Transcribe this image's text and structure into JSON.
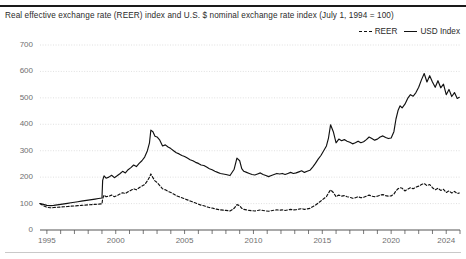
{
  "header": {
    "title_partial": "",
    "subtitle": "Real effective exchange rate (REER) index and U.S. $ nominal exchange rate index (July 1, 1994 = 100)"
  },
  "legend": {
    "position": "top-right",
    "items": [
      {
        "label": "REER",
        "style": "dashed",
        "color": "#111111"
      },
      {
        "label": "USD Index",
        "style": "solid",
        "color": "#111111"
      }
    ]
  },
  "axes": {
    "y_ticks": [
      "700",
      "600",
      "500",
      "400",
      "300",
      "200",
      "100",
      "0"
    ],
    "x_ticks": [
      "1995",
      "2000",
      "2005",
      "2010",
      "2015",
      "2020",
      "2024"
    ]
  },
  "colors": {
    "ink": "#231f20",
    "grid": "#d8d8d8",
    "axis": "#555555",
    "tick_text": "#6f6f6f",
    "series": "#111111"
  },
  "chart_data": {
    "type": "line",
    "title": "Real effective exchange rate (REER) index and U.S. $ nominal exchange rate index (July 1, 1994 = 100)",
    "xlabel": "",
    "ylabel": "",
    "xlim": [
      1994.5,
      2025.0
    ],
    "ylim": [
      0,
      700
    ],
    "grid": true,
    "legend_position": "top-right",
    "y_ticks": [
      0,
      100,
      200,
      300,
      400,
      500,
      600,
      700
    ],
    "x_ticks": [
      1995,
      2000,
      2005,
      2010,
      2015,
      2020,
      2024
    ],
    "x_tick_interval_minor": 1,
    "series": [
      {
        "name": "USD Index",
        "style": "solid",
        "color": "#111111",
        "x": [
          1994.5,
          1994.75,
          1995.0,
          1995.25,
          1995.5,
          1995.75,
          1996.0,
          1996.25,
          1996.5,
          1996.75,
          1997.0,
          1997.25,
          1997.5,
          1997.75,
          1998.0,
          1998.25,
          1998.5,
          1998.75,
          1999.0,
          1999.05,
          1999.15,
          1999.3,
          1999.5,
          1999.7,
          1999.9,
          2000.1,
          2000.3,
          2000.5,
          2000.7,
          2000.9,
          2001.1,
          2001.3,
          2001.5,
          2001.7,
          2001.9,
          2002.1,
          2002.3,
          2002.45,
          2002.55,
          2002.7,
          2002.85,
          2003.0,
          2003.2,
          2003.4,
          2003.6,
          2003.8,
          2004.0,
          2004.2,
          2004.4,
          2004.6,
          2004.8,
          2005.0,
          2005.2,
          2005.4,
          2005.6,
          2005.8,
          2006.0,
          2006.2,
          2006.4,
          2006.6,
          2006.8,
          2007.0,
          2007.2,
          2007.4,
          2007.6,
          2007.8,
          2008.0,
          2008.3,
          2008.6,
          2008.8,
          2009.0,
          2009.15,
          2009.3,
          2009.5,
          2009.7,
          2009.9,
          2010.1,
          2010.3,
          2010.5,
          2010.7,
          2010.9,
          2011.1,
          2011.3,
          2011.5,
          2011.7,
          2011.9,
          2012.1,
          2012.3,
          2012.5,
          2012.7,
          2012.9,
          2013.1,
          2013.3,
          2013.5,
          2013.7,
          2013.9,
          2014.1,
          2014.3,
          2014.5,
          2014.7,
          2014.9,
          2015.1,
          2015.3,
          2015.45,
          2015.6,
          2015.8,
          2016.0,
          2016.2,
          2016.4,
          2016.6,
          2016.8,
          2017.0,
          2017.2,
          2017.4,
          2017.6,
          2017.8,
          2018.0,
          2018.2,
          2018.4,
          2018.6,
          2018.8,
          2019.0,
          2019.2,
          2019.4,
          2019.6,
          2019.8,
          2020.0,
          2020.2,
          2020.35,
          2020.5,
          2020.65,
          2020.8,
          2021.0,
          2021.2,
          2021.4,
          2021.6,
          2021.8,
          2022.0,
          2022.2,
          2022.4,
          2022.6,
          2022.8,
          2023.0,
          2023.2,
          2023.4,
          2023.6,
          2023.8,
          2024.0,
          2024.2,
          2024.4,
          2024.6,
          2024.8,
          2024.95
        ],
        "y": [
          100,
          97,
          93,
          92,
          93,
          95,
          97,
          99,
          101,
          103,
          105,
          107,
          109,
          111,
          113,
          115,
          117,
          119,
          121,
          188,
          205,
          196,
          200,
          207,
          198,
          205,
          213,
          222,
          216,
          228,
          236,
          246,
          240,
          252,
          262,
          276,
          300,
          330,
          378,
          372,
          355,
          352,
          340,
          318,
          322,
          314,
          308,
          300,
          292,
          288,
          282,
          278,
          272,
          266,
          262,
          256,
          252,
          246,
          244,
          238,
          232,
          228,
          222,
          218,
          214,
          212,
          210,
          206,
          230,
          272,
          262,
          232,
          222,
          218,
          214,
          210,
          208,
          212,
          216,
          210,
          206,
          202,
          206,
          210,
          214,
          212,
          214,
          210,
          214,
          218,
          214,
          216,
          220,
          224,
          218,
          222,
          226,
          238,
          252,
          268,
          282,
          300,
          318,
          348,
          398,
          372,
          330,
          344,
          338,
          342,
          336,
          332,
          326,
          330,
          336,
          330,
          334,
          342,
          352,
          346,
          340,
          344,
          352,
          356,
          350,
          346,
          348,
          372,
          420,
          452,
          470,
          462,
          476,
          498,
          512,
          506,
          520,
          540,
          568,
          592,
          560,
          584,
          560,
          540,
          565,
          538,
          552,
          512,
          532,
          505,
          520,
          498,
          502
        ]
      },
      {
        "name": "REER",
        "style": "dashed",
        "color": "#111111",
        "x": [
          1994.5,
          1994.75,
          1995.0,
          1995.25,
          1995.5,
          1995.75,
          1996.0,
          1996.25,
          1996.5,
          1996.75,
          1997.0,
          1997.25,
          1997.5,
          1997.75,
          1998.0,
          1998.25,
          1998.5,
          1998.75,
          1999.0,
          1999.05,
          1999.15,
          1999.3,
          1999.5,
          1999.7,
          1999.9,
          2000.1,
          2000.3,
          2000.5,
          2000.7,
          2000.9,
          2001.1,
          2001.3,
          2001.5,
          2001.7,
          2001.9,
          2002.1,
          2002.3,
          2002.45,
          2002.55,
          2002.7,
          2002.85,
          2003.0,
          2003.2,
          2003.4,
          2003.6,
          2003.8,
          2004.0,
          2004.2,
          2004.4,
          2004.6,
          2004.8,
          2005.0,
          2005.2,
          2005.4,
          2005.6,
          2005.8,
          2006.0,
          2006.2,
          2006.4,
          2006.6,
          2006.8,
          2007.0,
          2007.2,
          2007.4,
          2007.6,
          2007.8,
          2008.0,
          2008.3,
          2008.6,
          2008.8,
          2009.0,
          2009.15,
          2009.3,
          2009.5,
          2009.7,
          2009.9,
          2010.1,
          2010.3,
          2010.5,
          2010.7,
          2010.9,
          2011.1,
          2011.3,
          2011.5,
          2011.7,
          2011.9,
          2012.1,
          2012.3,
          2012.5,
          2012.7,
          2012.9,
          2013.1,
          2013.3,
          2013.5,
          2013.7,
          2013.9,
          2014.1,
          2014.3,
          2014.5,
          2014.7,
          2014.9,
          2015.1,
          2015.3,
          2015.45,
          2015.6,
          2015.8,
          2016.0,
          2016.2,
          2016.4,
          2016.6,
          2016.8,
          2017.0,
          2017.2,
          2017.4,
          2017.6,
          2017.8,
          2018.0,
          2018.2,
          2018.4,
          2018.6,
          2018.8,
          2019.0,
          2019.2,
          2019.4,
          2019.6,
          2019.8,
          2020.0,
          2020.2,
          2020.35,
          2020.5,
          2020.65,
          2020.8,
          2021.0,
          2021.2,
          2021.4,
          2021.6,
          2021.8,
          2022.0,
          2022.2,
          2022.4,
          2022.6,
          2022.8,
          2023.0,
          2023.2,
          2023.4,
          2023.6,
          2023.8,
          2024.0,
          2024.2,
          2024.4,
          2024.6,
          2024.8,
          2024.95
        ],
        "y": [
          100,
          92,
          86,
          84,
          85,
          86,
          87,
          88,
          89,
          90,
          91,
          92,
          93,
          94,
          95,
          96,
          97,
          98,
          99,
          118,
          132,
          126,
          128,
          132,
          126,
          130,
          136,
          141,
          138,
          145,
          150,
          156,
          152,
          160,
          166,
          172,
          186,
          200,
          212,
          198,
          186,
          180,
          168,
          156,
          152,
          146,
          142,
          136,
          130,
          126,
          122,
          118,
          114,
          110,
          106,
          102,
          98,
          94,
          92,
          88,
          85,
          83,
          80,
          78,
          76,
          75,
          74,
          72,
          82,
          96,
          92,
          82,
          78,
          76,
          74,
          73,
          72,
          74,
          76,
          74,
          72,
          71,
          73,
          75,
          76,
          75,
          76,
          74,
          76,
          78,
          76,
          77,
          79,
          81,
          78,
          80,
          82,
          88,
          94,
          102,
          110,
          118,
          126,
          140,
          152,
          142,
          126,
          132,
          128,
          130,
          126,
          124,
          120,
          122,
          126,
          122,
          124,
          128,
          132,
          128,
          126,
          128,
          132,
          134,
          130,
          128,
          129,
          136,
          148,
          156,
          160,
          158,
          148,
          154,
          160,
          156,
          162,
          166,
          172,
          176,
          168,
          172,
          160,
          152,
          158,
          150,
          154,
          142,
          148,
          140,
          146,
          138,
          140
        ]
      }
    ]
  }
}
